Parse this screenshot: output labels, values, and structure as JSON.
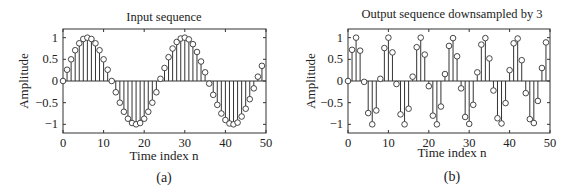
{
  "figure": {
    "panels": [
      {
        "caption": "(a)",
        "title": "Input sequence",
        "xlabel": "Time index n",
        "ylabel": "Amplitude"
      },
      {
        "caption": "(b)",
        "title": "Output sequence downsampled by 3",
        "xlabel": "Time index n",
        "ylabel": "Amplitude"
      }
    ]
  },
  "chart_data": [
    {
      "type": "stem",
      "title": "Input sequence",
      "xlabel": "Time index n",
      "ylabel": "Amplitude",
      "caption": "(a)",
      "xlim": [
        0,
        50
      ],
      "ylim": [
        -1.2,
        1.2
      ],
      "xticks": [
        0,
        10,
        20,
        30,
        40,
        50
      ],
      "yticks": [
        -1,
        -0.5,
        0,
        0.5,
        1
      ],
      "ytick_labels": [
        "−1",
        "−0.5",
        "0",
        "0.5",
        "1"
      ],
      "grid": false,
      "x": [
        0,
        1,
        2,
        3,
        4,
        5,
        6,
        7,
        8,
        9,
        10,
        11,
        12,
        13,
        14,
        15,
        16,
        17,
        18,
        19,
        20,
        21,
        22,
        23,
        24,
        25,
        26,
        27,
        28,
        29,
        30,
        31,
        32,
        33,
        34,
        35,
        36,
        37,
        38,
        39,
        40,
        41,
        42,
        43,
        44,
        45,
        46,
        47,
        48,
        49
      ],
      "values": [
        0,
        0.26,
        0.5,
        0.71,
        0.87,
        0.97,
        1.0,
        0.97,
        0.87,
        0.71,
        0.5,
        0.26,
        0.0,
        -0.26,
        -0.5,
        -0.71,
        -0.87,
        -0.97,
        -1.0,
        -0.97,
        -0.87,
        -0.71,
        -0.5,
        -0.26,
        0.05,
        0.3,
        0.55,
        0.75,
        0.9,
        0.98,
        1.0,
        0.96,
        0.85,
        0.67,
        0.45,
        0.2,
        -0.06,
        -0.32,
        -0.55,
        -0.75,
        -0.9,
        -0.98,
        -1.0,
        -0.96,
        -0.82,
        -0.64,
        -0.42,
        -0.17,
        0.1,
        0.35
      ]
    },
    {
      "type": "stem",
      "title": "Output sequence downsampled by 3",
      "xlabel": "Time index n",
      "ylabel": "Amplitude",
      "caption": "(b)",
      "xlim": [
        0,
        50
      ],
      "ylim": [
        -1.2,
        1.2
      ],
      "xticks": [
        0,
        10,
        20,
        30,
        40,
        50
      ],
      "yticks": [
        -1,
        -0.5,
        0,
        0.5,
        1
      ],
      "ytick_labels": [
        "−1",
        "−0.5",
        "0",
        "0.5",
        "1"
      ],
      "grid": false,
      "x": [
        0,
        1,
        2,
        3,
        4,
        5,
        6,
        7,
        8,
        9,
        10,
        11,
        12,
        13,
        14,
        15,
        16,
        17,
        18,
        19,
        20,
        21,
        22,
        23,
        24,
        25,
        26,
        27,
        28,
        29,
        30,
        31,
        32,
        33,
        34,
        35,
        36,
        37,
        38,
        39,
        40,
        41,
        42,
        43,
        44,
        45,
        46,
        47,
        48,
        49
      ],
      "values": [
        0,
        0.72,
        1.0,
        0.7,
        -0.02,
        -0.74,
        -1.0,
        -0.68,
        0.05,
        0.76,
        1.0,
        0.66,
        -0.07,
        -0.77,
        -1.0,
        -0.64,
        0.1,
        0.78,
        1.0,
        0.61,
        -0.12,
        -0.8,
        -1.0,
        -0.59,
        0.16,
        0.81,
        0.99,
        0.57,
        -0.17,
        -0.83,
        -0.99,
        -0.55,
        0.2,
        0.84,
        0.99,
        0.52,
        -0.22,
        -0.86,
        -0.98,
        -0.51,
        0.25,
        0.87,
        0.98,
        0.48,
        -0.28,
        -0.88,
        -0.97,
        -0.46,
        0.3,
        0.89
      ]
    }
  ]
}
